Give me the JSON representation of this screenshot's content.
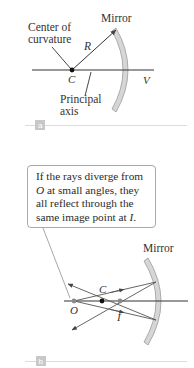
{
  "panel_a": {
    "tag": "a",
    "labels": {
      "mirror": "Mirror",
      "center_line1": "Center of",
      "center_line2": "curvature",
      "radius": "R",
      "center_point": "C",
      "vertex": "V",
      "axis_line1": "Principal",
      "axis_line2": "axis"
    }
  },
  "panel_b": {
    "tag": "b",
    "callout": {
      "line1": "If the rays diverge from",
      "line2_sym": "O",
      "line2_rest": " at small angles, they",
      "line3": "all reflect through the",
      "line4_prefix": "same image point at ",
      "line4_sym": "I",
      "line4_suffix": "."
    },
    "labels": {
      "mirror": "Mirror",
      "center_point": "C",
      "object_point": "O",
      "image_point": "I"
    }
  },
  "colors": {
    "line": "#333333",
    "mirror_fill": "#d6d6d6",
    "mirror_edge": "#9a9a9a",
    "divider": "#dcdcdc",
    "tag_box": "#c8c8c8",
    "callout_border": "#a8a8a8",
    "point_gray": "#8a8a8a"
  }
}
